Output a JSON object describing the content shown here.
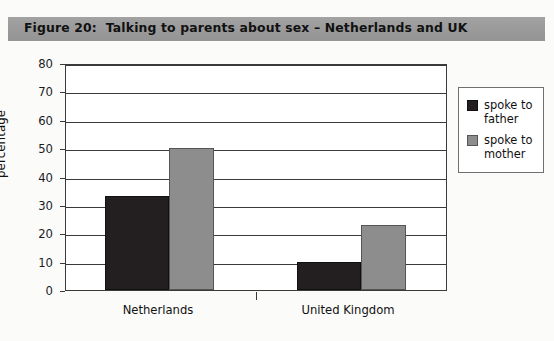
{
  "figure": {
    "title": "Figure 20:  Talking to parents about sex – Netherlands and UK",
    "title_bar_color": "#9d9d9d",
    "background_color": "#fbfbfa"
  },
  "chart_data": {
    "type": "bar",
    "title": "Figure 20:  Talking to parents about sex – Netherlands and UK",
    "categories": [
      "Netherlands",
      "United Kingdom"
    ],
    "series": [
      {
        "name": "spoke to father",
        "values": [
          33,
          10
        ],
        "color": "#231f20"
      },
      {
        "name": "spoke to mother",
        "values": [
          50,
          23
        ],
        "color": "#8d8d8d"
      }
    ],
    "xlabel": "",
    "ylabel": "percentage",
    "ylim": [
      0,
      80
    ],
    "yticks": [
      0,
      10,
      20,
      30,
      40,
      50,
      60,
      70,
      80
    ],
    "ytick_labels": [
      "0",
      "10",
      "20",
      "30",
      "40",
      "50",
      "60",
      "70",
      "80"
    ],
    "grid": true,
    "grid_axis": "y",
    "legend_position": "right",
    "legend_entries": [
      "spoke to father",
      "spoke to mother"
    ]
  },
  "axes": {
    "y_title": "percentage",
    "y_labels": [
      "80",
      "70",
      "60",
      "50",
      "40",
      "30",
      "20",
      "10",
      "0"
    ],
    "x_labels": [
      "Netherlands",
      "United Kingdom"
    ]
  },
  "legend": {
    "items": [
      {
        "label_line1": "spoke to",
        "label_line2": "father",
        "swatch": "dark-swatch"
      },
      {
        "label_line1": "spoke to",
        "label_line2": "mother",
        "swatch": "grey-swatch"
      }
    ]
  }
}
